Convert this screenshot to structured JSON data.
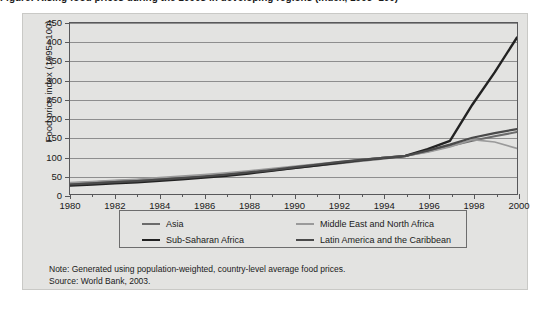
{
  "figure": {
    "title": "Figure: Rising food prices during the 1990s in developing regions (index, 1995=100)",
    "note": "Note: Generated using population-weighted, country-level average food  prices.",
    "source": "Source: World Bank, 2003."
  },
  "legend": {
    "position": "bottom",
    "columns": [
      [
        "Asia",
        "Sub-Saharan Africa"
      ],
      [
        "Middle East and North Africa",
        "Latin America and the Caribbean"
      ]
    ]
  },
  "colors": {
    "panel_bg": "#e3e3e1",
    "plot_border": "#58585a",
    "gridline": "#8e8e8e",
    "asia": "#6b6b6b",
    "sub_saharan_africa": "#222222",
    "middle_east_north_africa": "#9a9a9a",
    "latin_america_caribbean": "#4a4a4a"
  },
  "chart_data": {
    "type": "line",
    "title": "",
    "xlabel": "",
    "ylabel": "Food price index (1995=100)",
    "xlim": [
      1980,
      2000
    ],
    "ylim": [
      0,
      450
    ],
    "yticks": [
      0,
      50,
      100,
      150,
      200,
      250,
      300,
      350,
      400,
      450
    ],
    "xticks": [
      1980,
      1982,
      1984,
      1986,
      1988,
      1990,
      1992,
      1994,
      1996,
      1998,
      2000
    ],
    "xticks_minor": [
      1981,
      1983,
      1985,
      1987,
      1989,
      1991,
      1993,
      1995,
      1997,
      1999
    ],
    "grid": true,
    "x": [
      1980,
      1981,
      1982,
      1983,
      1984,
      1985,
      1986,
      1987,
      1988,
      1989,
      1990,
      1991,
      1992,
      1993,
      1994,
      1995,
      1996,
      1997,
      1998,
      1999,
      2000
    ],
    "series": [
      {
        "name": "Asia",
        "color": "#6b6b6b",
        "width": 2.0,
        "values": [
          28,
          31,
          34,
          37,
          40,
          43,
          47,
          51,
          56,
          62,
          68,
          74,
          80,
          87,
          93,
          100,
          112,
          126,
          140,
          152,
          163
        ]
      },
      {
        "name": "Sub-Saharan Africa",
        "color": "#222222",
        "width": 2.4,
        "values": [
          22,
          25,
          28,
          31,
          35,
          39,
          43,
          48,
          54,
          61,
          68,
          75,
          82,
          89,
          95,
          100,
          118,
          140,
          235,
          320,
          412
        ]
      },
      {
        "name": "Middle East and North Africa",
        "color": "#9a9a9a",
        "width": 1.6,
        "values": [
          30,
          33,
          36,
          39,
          43,
          47,
          51,
          56,
          61,
          67,
          73,
          79,
          85,
          91,
          96,
          100,
          110,
          124,
          143,
          137,
          120
        ]
      },
      {
        "name": "Latin America and the Caribbean",
        "color": "#4a4a4a",
        "width": 2.2,
        "values": [
          25,
          28,
          31,
          34,
          38,
          42,
          46,
          51,
          57,
          63,
          70,
          77,
          84,
          90,
          95,
          100,
          114,
          130,
          148,
          160,
          171
        ]
      }
    ]
  }
}
